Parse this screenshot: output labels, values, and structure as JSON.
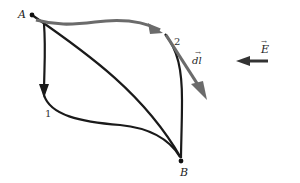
{
  "diagram": {
    "points": {
      "A": {
        "label": "A",
        "x": 32,
        "y": 15
      },
      "B": {
        "label": "B",
        "x": 181,
        "y": 161
      }
    },
    "paths": [
      {
        "id": "path-1",
        "label": "1",
        "label_pos": {
          "x": 45,
          "y": 117
        }
      },
      {
        "id": "path-2",
        "label": "2",
        "label_pos": {
          "x": 176,
          "y": 43
        }
      },
      {
        "id": "path-direct",
        "label": ""
      }
    ],
    "vectors": {
      "dl": {
        "label": "dl",
        "arrow_mark": "→",
        "color": "#6b6b6b"
      },
      "E": {
        "label": "E",
        "arrow_mark": "→",
        "color": "#333333"
      }
    },
    "colors": {
      "path_black": "#1a1a1a",
      "path_gray": "#6b6b6b",
      "background": "#ffffff"
    }
  }
}
